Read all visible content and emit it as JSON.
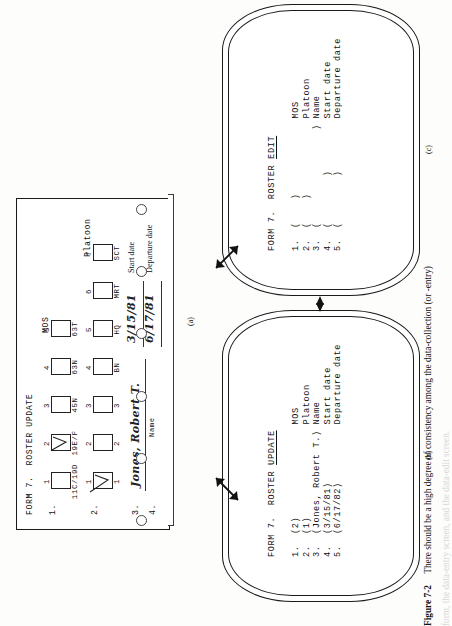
{
  "figure": {
    "number": "Figure 7-2",
    "caption_line1": "There should be a high degree of consistency among the data-collection (or -entry)",
    "caption_line2": "form, the data-entry screen, and the data-edit screen."
  },
  "panels": {
    "a_label": "(a)",
    "b_label": "(b)",
    "c_label": "(c)"
  },
  "form": {
    "header": "FORM 7.  ROSTER UPDATE",
    "rows": [
      {
        "no": "1.",
        "group": "MOS",
        "boxes": [
          {
            "num": "1",
            "label": "11C/19D",
            "checked": false
          },
          {
            "num": "2",
            "label": "19E/F",
            "checked": true
          },
          {
            "num": "3",
            "label": "45N",
            "checked": false
          },
          {
            "num": "4",
            "label": "63N",
            "checked": false
          },
          {
            "num": "5",
            "label": "63T",
            "checked": false
          }
        ]
      },
      {
        "no": "2.",
        "group": "Platoon",
        "boxes": [
          {
            "num": "1",
            "label": "1",
            "checked": true
          },
          {
            "num": "2",
            "label": "2",
            "checked": false
          },
          {
            "num": "3",
            "label": "3",
            "checked": false
          },
          {
            "num": "4",
            "label": "BN",
            "checked": false
          },
          {
            "num": "5",
            "label": "HQ",
            "checked": false
          },
          {
            "num": "6",
            "label": "MRT",
            "checked": false
          },
          {
            "num": "7",
            "label": "SCT",
            "checked": false
          }
        ]
      }
    ],
    "write_rows": [
      {
        "no": "3.",
        "value": "Jones, Robert T.",
        "label": "Name"
      },
      {
        "no": "4.",
        "value": "3/15/81",
        "label": "Start date"
      },
      {
        "no": "5.",
        "value": "6/17/81",
        "label": "Departure date"
      }
    ],
    "hole_count": 6
  },
  "screen_update": {
    "title_prefix": "FORM 7.  ROSTER ",
    "title_underlined": "UPDATE",
    "lines": [
      "1.  (2)                MOS",
      "2.  (1)                Platoon",
      "3.  (Jones, Robert T.) Name",
      "4.  (3/15/81)          Start date",
      "5.  (6/17/82)          Departure date"
    ]
  },
  "screen_edit": {
    "title_prefix": "FORM 7.  ROSTER ",
    "title_underlined": "EDIT",
    "lines": [
      "1.  (    )             MOS",
      "2.  (    )             Platoon",
      "3.  (                ) Name",
      "4.  (        )         Start date",
      "5.  (        )         Departure date"
    ]
  },
  "colors": {
    "ink": "#1a1a1a",
    "paper": "#fdfdfb",
    "screen": "#ffffff"
  }
}
